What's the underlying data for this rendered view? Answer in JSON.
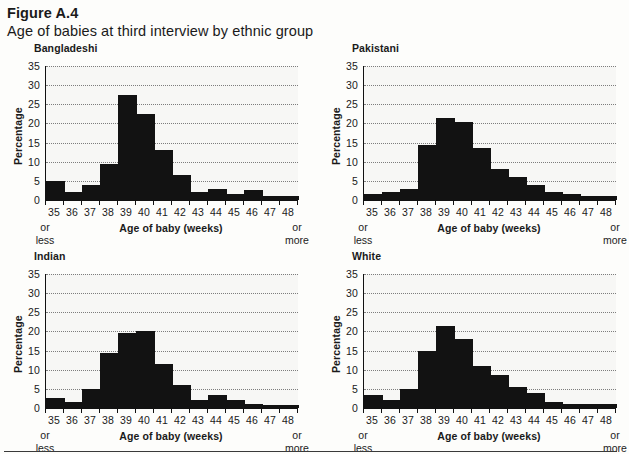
{
  "figure": {
    "number": "Figure A.4",
    "title": "Age of babies at third interview by ethnic group"
  },
  "axis": {
    "ylabel": "Percentage",
    "xlabel": "Age of baby (weeks)",
    "yticks": [
      "0",
      "5",
      "10",
      "15",
      "20",
      "25",
      "30",
      "35"
    ],
    "xticks": [
      "35",
      "36",
      "37",
      "38",
      "39",
      "40",
      "41",
      "42",
      "43",
      "44",
      "45",
      "46",
      "47",
      "48"
    ],
    "left_note_line1": "or",
    "left_note_line2": "less",
    "right_note_line1": "or",
    "right_note_line2": "more"
  },
  "colors": {
    "bar": "#121212",
    "plot_background": "#f7f7f5",
    "gridline": "#7d7d7d",
    "axis": "#111111",
    "page_background": "#fdfdfb"
  },
  "chart_data": [
    {
      "type": "bar",
      "title": "Bangladeshi",
      "xlabel": "Age of baby (weeks)",
      "ylabel": "Percentage",
      "ylim": [
        0,
        35
      ],
      "grid": true,
      "categories": [
        "35",
        "36",
        "37",
        "38",
        "39",
        "40",
        "41",
        "42",
        "43",
        "44",
        "45",
        "46",
        "47",
        "48"
      ],
      "values": [
        5,
        2,
        4,
        9.5,
        27.5,
        22.5,
        13,
        6.5,
        2,
        3,
        1.5,
        2.5,
        1,
        1
      ]
    },
    {
      "type": "bar",
      "title": "Pakistani",
      "xlabel": "Age of baby (weeks)",
      "ylabel": "Percentage",
      "ylim": [
        0,
        35
      ],
      "grid": true,
      "categories": [
        "35",
        "36",
        "37",
        "38",
        "39",
        "40",
        "41",
        "42",
        "43",
        "44",
        "45",
        "46",
        "47",
        "48"
      ],
      "values": [
        1.5,
        2,
        3,
        14.5,
        21.5,
        20.5,
        13.5,
        8,
        6,
        4,
        2,
        1.5,
        1,
        1
      ]
    },
    {
      "type": "bar",
      "title": "Indian",
      "xlabel": "Age of baby (weeks)",
      "ylabel": "Percentage",
      "ylim": [
        0,
        35
      ],
      "grid": true,
      "categories": [
        "35",
        "36",
        "37",
        "38",
        "39",
        "40",
        "41",
        "42",
        "43",
        "44",
        "45",
        "46",
        "47",
        "48"
      ],
      "values": [
        2.5,
        1.5,
        5,
        14.5,
        19.5,
        20,
        11.5,
        6,
        2,
        3.5,
        2,
        1,
        0.7,
        0.7
      ]
    },
    {
      "type": "bar",
      "title": "White",
      "xlabel": "Age of baby (weeks)",
      "ylabel": "Percentage",
      "ylim": [
        0,
        35
      ],
      "grid": true,
      "categories": [
        "35",
        "36",
        "37",
        "38",
        "39",
        "40",
        "41",
        "42",
        "43",
        "44",
        "45",
        "46",
        "47",
        "48"
      ],
      "values": [
        3.5,
        2,
        5,
        15,
        21.5,
        18,
        11,
        8.5,
        5.5,
        4,
        1.5,
        1,
        1,
        1
      ]
    }
  ]
}
